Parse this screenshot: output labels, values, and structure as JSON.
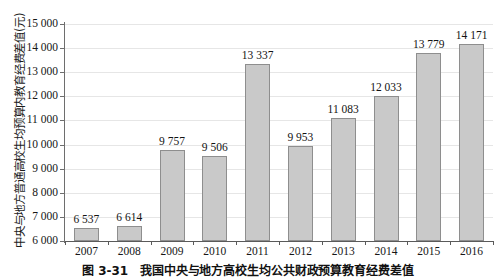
{
  "chart_data": {
    "type": "bar",
    "title": "",
    "xlabel": "",
    "ylabel": "中央与地方普通高校生均预算内教育经费差值(元)",
    "categories": [
      "2007",
      "2008",
      "2009",
      "2010",
      "2011",
      "2012",
      "2013",
      "2014",
      "2015",
      "2016"
    ],
    "values": [
      6537,
      6614,
      9757,
      9506,
      13337,
      9953,
      11083,
      12033,
      13779,
      14171
    ],
    "value_labels": [
      "6 537",
      "6 614",
      "9 757",
      "9 506",
      "13 337",
      "9 953",
      "11 083",
      "12 033",
      "13 779",
      "14 171"
    ],
    "ylim": [
      6000,
      15000
    ],
    "ytick_values": [
      6000,
      7000,
      8000,
      9000,
      10000,
      11000,
      12000,
      13000,
      14000,
      15000
    ],
    "ytick_labels": [
      "6 000",
      "7 000",
      "8 000",
      "9 000",
      "10 000",
      "11 000",
      "12 000",
      "13 000",
      "14 000",
      "15 000"
    ],
    "grid": true,
    "legend": false,
    "bar_color": "#c9c9c9",
    "bar_border_color": "#8e8e8e",
    "gridline_color": "#e6e6e6",
    "axis_color": "#5a5a5a"
  },
  "caption": {
    "number": "图 3-31",
    "text": "我国中央与地方高校生均公共财政预算教育经费差值"
  }
}
